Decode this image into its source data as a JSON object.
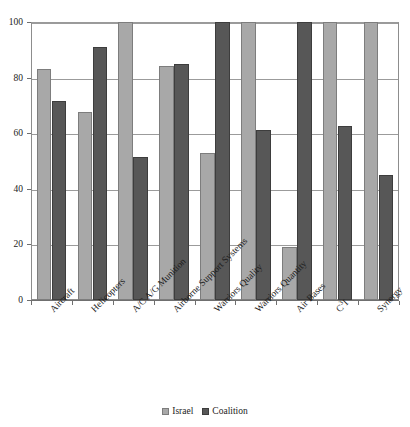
{
  "chart_data": {
    "type": "bar",
    "title": "",
    "subtitle": "",
    "xlabel": "",
    "ylabel": "",
    "ylim": [
      0,
      100
    ],
    "yticks": [
      0,
      20,
      40,
      60,
      80,
      100
    ],
    "ytick_labels": [
      "0",
      "20",
      "40",
      "60",
      "80",
      "100"
    ],
    "grid": "horizontal",
    "legend_position": "bottom-center",
    "categories": [
      "Aircraft",
      "Helicopters",
      "A/C A/G Munition",
      "Airborne Support Systems",
      "Warriors Quality",
      "Warriors Quantity",
      "Air Bases",
      "C³I",
      "Synergy"
    ],
    "series": [
      {
        "name": "Israel",
        "color": "#a8a8a8",
        "values": [
          83,
          67.5,
          100,
          84,
          53,
          100,
          19,
          100,
          100
        ]
      },
      {
        "name": "Coalition",
        "color": "#575757",
        "values": [
          71.5,
          91,
          51.5,
          85,
          100,
          61,
          100,
          62.5,
          45
        ]
      }
    ]
  },
  "legend": {
    "items": [
      {
        "label": "Israel",
        "swatch": "israel"
      },
      {
        "label": "Coalition",
        "swatch": "coalition"
      }
    ]
  }
}
